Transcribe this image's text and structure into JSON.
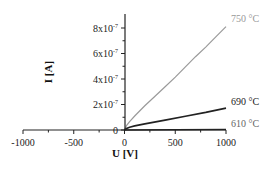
{
  "chart_data": {
    "type": "line",
    "title": "",
    "xlabel": "U [V]",
    "ylabel": "I [A]",
    "xlim": [
      -1000,
      1000
    ],
    "ylim": [
      0,
      9e-07
    ],
    "grid": false,
    "legend_position": "inline labels at right end of curves",
    "x_ticks": [
      {
        "value": -1000,
        "label": "-1000"
      },
      {
        "value": -500,
        "label": "-500"
      },
      {
        "value": 0,
        "label": "0"
      },
      {
        "value": 500,
        "label": "500"
      },
      {
        "value": 1000,
        "label": "1000"
      }
    ],
    "y_ticks": [
      {
        "value": 0,
        "label": "0"
      },
      {
        "value": 2e-07,
        "label": "2x10",
        "exp": "-7"
      },
      {
        "value": 4e-07,
        "label": "4x10",
        "exp": "-7"
      },
      {
        "value": 6e-07,
        "label": "6x10",
        "exp": "-7"
      },
      {
        "value": 8e-07,
        "label": "8x10",
        "exp": "-7"
      }
    ],
    "series": [
      {
        "name": "750 °C",
        "color": "#9a9a9a",
        "x": [
          0,
          20,
          50,
          100,
          200,
          300,
          400,
          500,
          600,
          700,
          800,
          900,
          1000
        ],
        "y": [
          0,
          3.5e-08,
          6.5e-08,
          1.1e-07,
          1.9e-07,
          2.65e-07,
          3.4e-07,
          4.15e-07,
          4.95e-07,
          5.75e-07,
          6.5e-07,
          7.3e-07,
          8.1e-07
        ]
      },
      {
        "name": "690 °C",
        "color": "#222222",
        "x": [
          0,
          20,
          50,
          100,
          200,
          400,
          600,
          800,
          1000
        ],
        "y": [
          0,
          1.2e-08,
          2.2e-08,
          3.2e-08,
          4.8e-08,
          7.8e-08,
          1.08e-07,
          1.38e-07,
          1.72e-07
        ]
      },
      {
        "name": "610 °C",
        "color": "#222222",
        "x": [
          0,
          500,
          1000
        ],
        "y": [
          0,
          2e-09,
          4e-09
        ]
      }
    ]
  }
}
